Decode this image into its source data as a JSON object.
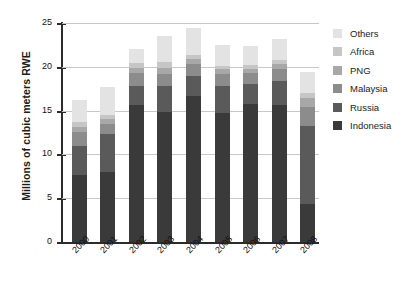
{
  "chart_data": {
    "type": "bar",
    "stacked": true,
    "title": "",
    "xlabel": "",
    "ylabel": "Millions of cubic meters RWE",
    "categories": [
      "2000",
      "2001",
      "2002",
      "2003",
      "2004",
      "2005",
      "2006",
      "2007",
      "2008"
    ],
    "ylim": [
      0,
      25
    ],
    "yticks": [
      0,
      5,
      10,
      15,
      20,
      25
    ],
    "ytick_labels": [
      "0",
      "5",
      "10",
      "15",
      "20",
      "25"
    ],
    "grid": true,
    "legend_position": "right",
    "series": [
      {
        "name": "Indonesia",
        "color": "#3a3a3a",
        "values": [
          7.7,
          8.0,
          15.6,
          14.8,
          16.7,
          14.7,
          15.7,
          15.6,
          4.3
        ]
      },
      {
        "name": "Russia",
        "color": "#5a5a5a",
        "values": [
          3.3,
          4.3,
          2.2,
          3.0,
          2.2,
          3.1,
          2.3,
          2.8,
          8.9
        ]
      },
      {
        "name": "Malaysia",
        "color": "#8c8c8c",
        "values": [
          1.6,
          1.2,
          1.5,
          1.4,
          1.4,
          1.4,
          1.3,
          1.3,
          2.2
        ]
      },
      {
        "name": "PNG",
        "color": "#a8a8a8",
        "values": [
          0.5,
          0.5,
          0.6,
          0.7,
          0.6,
          0.5,
          0.5,
          0.6,
          1.1
        ]
      },
      {
        "name": "Africa",
        "color": "#c6c6c6",
        "values": [
          0.6,
          0.5,
          0.5,
          0.6,
          0.5,
          0.4,
          0.4,
          0.5,
          0.5
        ]
      },
      {
        "name": "Others",
        "color": "#e3e3e3",
        "values": [
          2.5,
          3.2,
          1.6,
          3.0,
          3.0,
          2.4,
          2.2,
          2.4,
          2.4
        ]
      }
    ],
    "totals": [
      16.2,
      17.7,
      22.0,
      23.5,
      24.4,
      22.5,
      22.4,
      23.2,
      19.4
    ]
  },
  "legend": {
    "items": [
      {
        "label": "Others",
        "color": "#e3e3e3"
      },
      {
        "label": "Africa",
        "color": "#c6c6c6"
      },
      {
        "label": "PNG",
        "color": "#a8a8a8"
      },
      {
        "label": "Malaysia",
        "color": "#8c8c8c"
      },
      {
        "label": "Russia",
        "color": "#5a5a5a"
      },
      {
        "label": "Indonesia",
        "color": "#3a3a3a"
      }
    ]
  },
  "colors": {
    "axis": "#2b2b2b",
    "grid": "#c8c8c8",
    "text": "#1b1b1b",
    "background": "#ffffff"
  }
}
